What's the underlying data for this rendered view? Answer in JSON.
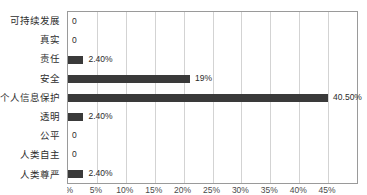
{
  "chart_data": {
    "type": "bar",
    "orientation": "horizontal",
    "title": "",
    "subtitle": "",
    "xlabel": "",
    "ylabel": "",
    "categories": [
      "可持续发展",
      "真实",
      "责任",
      "安全",
      "个人信息保护",
      "透明",
      "公平",
      "人类自主",
      "人类尊严"
    ],
    "values": [
      0,
      0,
      2.4,
      19,
      40.5,
      2.4,
      0,
      0,
      2.4
    ],
    "data_labels": [
      "0",
      "0",
      "2.40%",
      "19%",
      "40.50%",
      "2.40%",
      "0",
      "0",
      "2.40%"
    ],
    "xlim": [
      0,
      45
    ],
    "tick_values": [
      0,
      4.5,
      9,
      13.5,
      18,
      22.5,
      27,
      31.5,
      36,
      40.5,
      45
    ],
    "tick_labels": [
      "0%",
      "5%",
      "10%",
      "15%",
      "20%",
      "25%",
      "30%",
      "35%",
      "40%",
      "45%",
      ""
    ],
    "grid": "vertical",
    "gridline_count": 9,
    "legend": "none",
    "series": [
      {
        "name": "占比",
        "values": [
          0,
          0,
          2.4,
          19,
          40.5,
          2.4,
          0,
          0,
          2.4
        ]
      }
    ]
  },
  "style": {
    "bar_color": "#3a3a3a",
    "gridline_color": "#d3d3d3",
    "plot_border_color": "#9a9a9a",
    "text_color": "#2b2b2b",
    "background": "#ffffff"
  }
}
